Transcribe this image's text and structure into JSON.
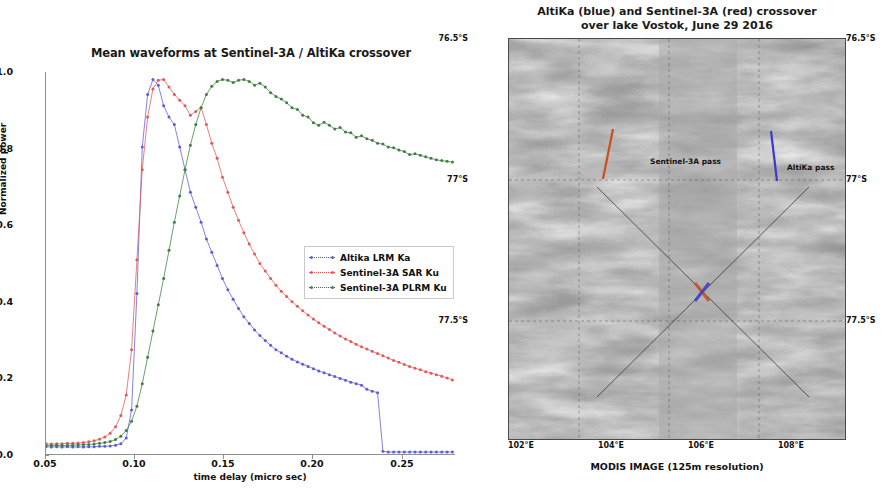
{
  "left_panel": {
    "title": "Mean waveforms at Sentinel-3A / AltiKa crossover",
    "xlabel": "time delay (micro sec)",
    "ylabel": "Normalized power",
    "xticks": [
      "0.05",
      "0.10",
      "0.15",
      "0.20",
      "0.25"
    ],
    "yticks": [
      "0.0",
      "0.2",
      "0.4",
      "0.6",
      "0.8",
      "1.0"
    ],
    "legend": [
      {
        "label": "Altika LRM Ka",
        "color": "#5c5cd6"
      },
      {
        "label": "Sentinel-3A SAR Ku",
        "color": "#e05a5a"
      },
      {
        "label": "Sentinel-3A PLRM Ku",
        "color": "#3f7f3f"
      }
    ]
  },
  "right_panel": {
    "title_line1": "AltiKa (blue) and Sentinel-3A (red) crossover",
    "title_line2": "over lake Vostok, June 29 2016",
    "caption": "MODIS IMAGE (125m resolution)",
    "lat_ticks": [
      "76.5°S",
      "77°S",
      "77.5°S"
    ],
    "lon_ticks": [
      "102°E",
      "104°E",
      "106°E",
      "108°E"
    ],
    "annotations": [
      {
        "label": "Sentinel-3A pass",
        "color": "#c8501e"
      },
      {
        "label": "AltiKa pass",
        "color": "#3b3bc8"
      }
    ]
  },
  "chart_data": {
    "type": "line",
    "title": "Mean waveforms at Sentinel-3A / AltiKa crossover",
    "xlabel": "time delay (micro sec)",
    "ylabel": "Normalized power",
    "xlim": [
      0.05,
      0.28
    ],
    "ylim": [
      0.0,
      1.02
    ],
    "grid": false,
    "legend_position": "center-right",
    "x": [
      0.05,
      0.053,
      0.056,
      0.059,
      0.062,
      0.065,
      0.068,
      0.071,
      0.074,
      0.077,
      0.08,
      0.083,
      0.086,
      0.089,
      0.092,
      0.095,
      0.098,
      0.101,
      0.104,
      0.107,
      0.11,
      0.113,
      0.116,
      0.119,
      0.122,
      0.125,
      0.128,
      0.131,
      0.134,
      0.137,
      0.14,
      0.143,
      0.146,
      0.149,
      0.152,
      0.155,
      0.158,
      0.161,
      0.164,
      0.167,
      0.17,
      0.173,
      0.176,
      0.179,
      0.182,
      0.185,
      0.188,
      0.191,
      0.194,
      0.197,
      0.2,
      0.203,
      0.206,
      0.209,
      0.212,
      0.215,
      0.218,
      0.221,
      0.224,
      0.227,
      0.23,
      0.233,
      0.236,
      0.239,
      0.242,
      0.245,
      0.248,
      0.251,
      0.254,
      0.257,
      0.26,
      0.263,
      0.266,
      0.269,
      0.272,
      0.275,
      0.278
    ],
    "series": [
      {
        "name": "Altika LRM Ka",
        "color": "#5c5cd6",
        "values": [
          0.022,
          0.021,
          0.022,
          0.021,
          0.022,
          0.021,
          0.022,
          0.021,
          0.022,
          0.022,
          0.023,
          0.023,
          0.024,
          0.026,
          0.03,
          0.045,
          0.12,
          0.43,
          0.82,
          0.96,
          1.0,
          0.985,
          0.93,
          0.9,
          0.88,
          0.82,
          0.76,
          0.7,
          0.66,
          0.62,
          0.575,
          0.54,
          0.505,
          0.47,
          0.44,
          0.415,
          0.39,
          0.368,
          0.35,
          0.333,
          0.318,
          0.305,
          0.292,
          0.28,
          0.272,
          0.263,
          0.255,
          0.248,
          0.242,
          0.236,
          0.23,
          0.224,
          0.219,
          0.214,
          0.209,
          0.204,
          0.199,
          0.194,
          0.19,
          0.186,
          0.175,
          0.17,
          0.166,
          0.01,
          0.008,
          0.008,
          0.008,
          0.008,
          0.008,
          0.008,
          0.008,
          0.008,
          0.008,
          0.008,
          0.008,
          0.008,
          0.008
        ]
      },
      {
        "name": "Sentinel-3A SAR Ku",
        "color": "#e05a5a",
        "values": [
          0.03,
          0.029,
          0.03,
          0.03,
          0.031,
          0.031,
          0.032,
          0.033,
          0.035,
          0.038,
          0.042,
          0.048,
          0.058,
          0.075,
          0.105,
          0.16,
          0.28,
          0.52,
          0.76,
          0.9,
          0.975,
          0.998,
          1.0,
          0.98,
          0.96,
          0.945,
          0.93,
          0.905,
          0.915,
          0.925,
          0.88,
          0.83,
          0.79,
          0.74,
          0.7,
          0.66,
          0.625,
          0.592,
          0.562,
          0.535,
          0.51,
          0.49,
          0.47,
          0.452,
          0.436,
          0.422,
          0.408,
          0.396,
          0.384,
          0.373,
          0.362,
          0.352,
          0.343,
          0.334,
          0.325,
          0.317,
          0.309,
          0.302,
          0.295,
          0.288,
          0.282,
          0.276,
          0.27,
          0.264,
          0.258,
          0.252,
          0.247,
          0.241,
          0.236,
          0.231,
          0.227,
          0.222,
          0.218,
          0.214,
          0.21,
          0.205,
          0.2
        ]
      },
      {
        "name": "Sentinel-3A PLRM Ku",
        "color": "#3f7f3f",
        "values": [
          0.026,
          0.025,
          0.026,
          0.025,
          0.026,
          0.026,
          0.027,
          0.027,
          0.028,
          0.029,
          0.031,
          0.033,
          0.036,
          0.041,
          0.05,
          0.065,
          0.09,
          0.13,
          0.19,
          0.26,
          0.33,
          0.4,
          0.47,
          0.545,
          0.62,
          0.69,
          0.76,
          0.825,
          0.88,
          0.925,
          0.96,
          0.982,
          0.995,
          1.0,
          0.998,
          0.992,
          0.998,
          1.0,
          0.995,
          0.985,
          0.99,
          0.98,
          0.965,
          0.955,
          0.948,
          0.938,
          0.925,
          0.92,
          0.905,
          0.9,
          0.885,
          0.878,
          0.886,
          0.878,
          0.868,
          0.872,
          0.86,
          0.858,
          0.846,
          0.85,
          0.842,
          0.838,
          0.83,
          0.828,
          0.82,
          0.818,
          0.812,
          0.808,
          0.8,
          0.802,
          0.798,
          0.794,
          0.79,
          0.786,
          0.784,
          0.782,
          0.78
        ]
      }
    ]
  }
}
